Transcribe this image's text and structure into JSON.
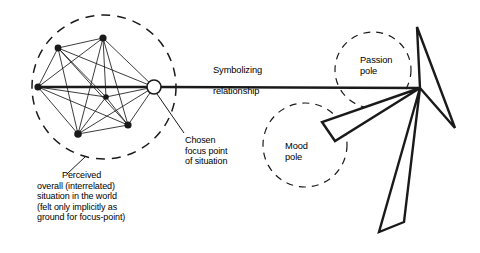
{
  "diagram": {
    "background_color": "#ffffff",
    "line_color": "#1a1a1a",
    "labels": {
      "symbolizing_line1": "Symbolizing",
      "symbolizing_line2": "relationship",
      "passion_pole_line1": "Passion",
      "passion_pole_line2": "pole",
      "mood_pole_line1": "Mood",
      "mood_pole_line2": "pole",
      "chosen_focus": "Chosen\nfocus point\nof situation",
      "perceived_situation_first": "Perceived",
      "perceived_situation_rest": "overall (interrelated)\nsituation in the world\n(felt only implicitly as\nground for focus-point)"
    },
    "regions": [
      {
        "name": "perceived-situation-circle",
        "cx": 104,
        "cy": 87,
        "r": 72,
        "style": "dashed"
      },
      {
        "name": "passion-pole-circle",
        "cx": 373,
        "cy": 70,
        "r": 38,
        "style": "dashed"
      },
      {
        "name": "mood-pole-circle",
        "cx": 305,
        "cy": 145,
        "r": 42,
        "style": "dashed"
      }
    ],
    "nodes": [
      {
        "name": "node-left",
        "x": 38,
        "y": 87
      },
      {
        "name": "node-upper-left",
        "x": 58,
        "y": 48
      },
      {
        "name": "node-top",
        "x": 103,
        "y": 38
      },
      {
        "name": "node-center",
        "x": 106,
        "y": 97
      },
      {
        "name": "node-bottom",
        "x": 78,
        "y": 134
      },
      {
        "name": "node-lower-right",
        "x": 128,
        "y": 125
      }
    ],
    "focus_point": {
      "name": "chosen-focus-point",
      "x": 154,
      "y": 87,
      "r": 7
    },
    "apex_point": {
      "name": "symbol-apex-point",
      "x": 420,
      "y": 88
    },
    "poles": [
      {
        "name": "passion-pole-blade",
        "points": "420,88 417,27 455,128"
      },
      {
        "name": "mood-pole-blade-left",
        "points": "420,88 322,122 335,141"
      },
      {
        "name": "mood-pole-blade-down",
        "points": "420,88 379,232 404,222"
      }
    ]
  }
}
